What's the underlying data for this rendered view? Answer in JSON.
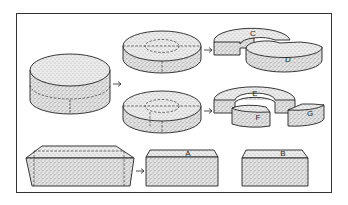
{
  "figure": {
    "labels": {
      "c": "C",
      "d": "D",
      "e": "E",
      "f": "F",
      "g": "G",
      "a": "A",
      "b": "B"
    },
    "colors": {
      "ink": "#222222",
      "paper": "#ffffff",
      "stipple": "#555555"
    },
    "arrow_glyph": "→"
  }
}
